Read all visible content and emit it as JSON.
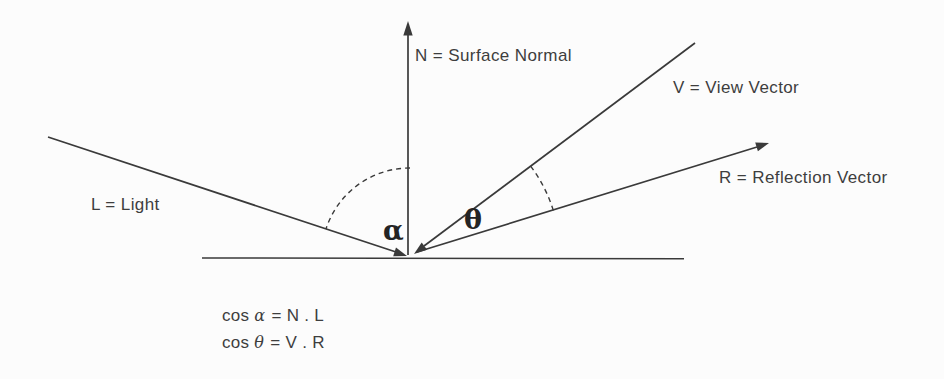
{
  "diagram": {
    "labels": {
      "normal": "N = Surface Normal",
      "view": "V = View Vector",
      "reflection": "R = Reflection Vector",
      "light": "L = Light",
      "alpha": "α",
      "theta": "θ"
    },
    "formulas": [
      {
        "func": "cos",
        "angle": "α",
        "rhs": "= N . L"
      },
      {
        "func": "cos",
        "angle": "θ",
        "rhs": "= V . R"
      }
    ],
    "colors": {
      "line": "#3a3a3a",
      "text": "#3e3e3e",
      "background": "#fcfcfc"
    }
  }
}
